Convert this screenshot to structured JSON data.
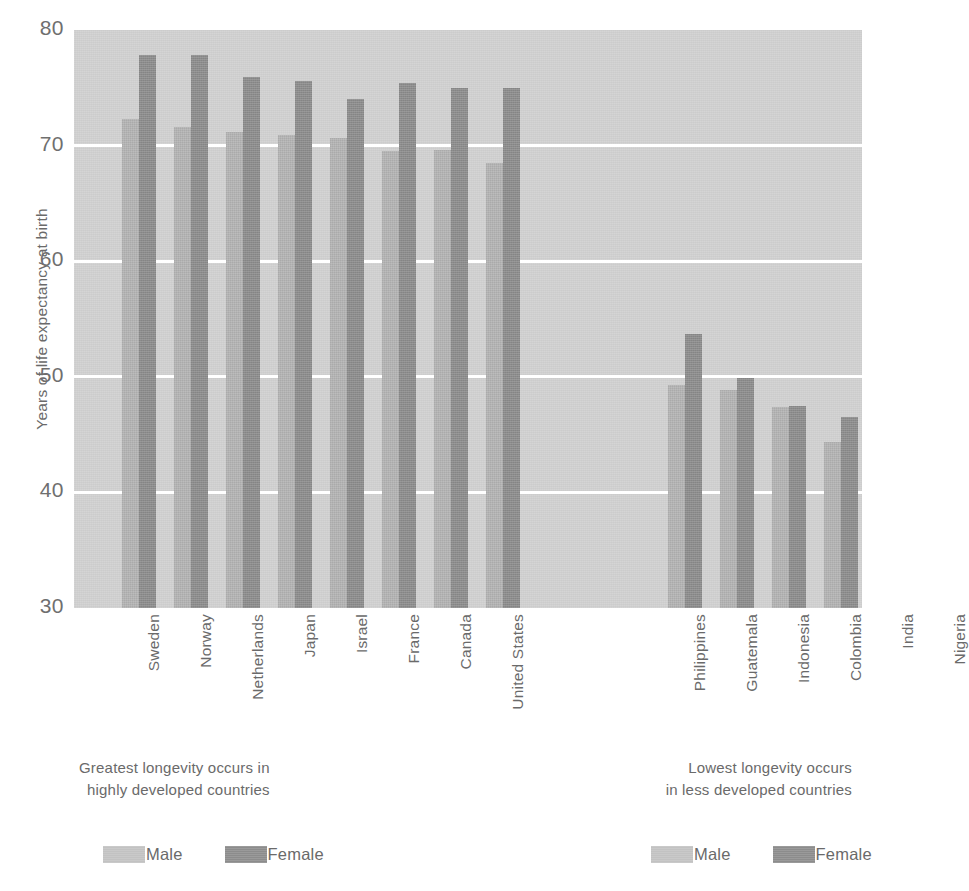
{
  "chart_data": {
    "type": "bar",
    "title": "",
    "xlabel": "",
    "ylabel": "Years of life expectancy at birth",
    "ylim": [
      30,
      80
    ],
    "yticks": [
      80,
      70,
      60,
      50,
      40,
      30
    ],
    "grid": true,
    "legend_position": "bottom",
    "series": [
      {
        "name": "Male",
        "color": "#b3b3b3",
        "values": [
          72.3,
          71.6,
          71.2,
          70.9,
          70.7,
          69.5,
          69.6,
          68.5,
          49.3,
          48.9,
          47.4,
          44.4,
          41.9,
          37.9
        ]
      },
      {
        "name": "Female",
        "color": "#8c8c8c",
        "values": [
          77.8,
          77.8,
          75.9,
          75.6,
          74.0,
          75.4,
          75.0,
          75.0,
          53.7,
          49.9,
          47.5,
          46.5,
          40.8,
          37.5
        ]
      }
    ],
    "categories": [
      "Sweden",
      "Norway",
      "Netherlands",
      "Japan",
      "Israel",
      "France",
      "Canada",
      "United States",
      "Philippines",
      "Guatemala",
      "Indonesia",
      "Colombia",
      "India",
      "Nigeria"
    ],
    "groups": [
      {
        "name": "developed",
        "caption_line_1": "Greatest longevity occurs in",
        "caption_line_2": "highly developed countries",
        "categories": [
          "Sweden",
          "Norway",
          "Netherlands",
          "Japan",
          "Israel",
          "France",
          "Canada",
          "United States"
        ]
      },
      {
        "name": "less-developed",
        "caption_line_1": "Lowest longevity occurs",
        "caption_line_2": "in less developed countries",
        "categories": [
          "Philippines",
          "Guatemala",
          "Indonesia",
          "Colombia",
          "India",
          "Nigeria"
        ]
      }
    ]
  },
  "axis": {
    "y_title": "Years of life expectancy at birth",
    "y_ticks": [
      "80",
      "70",
      "60",
      "50",
      "40",
      "30"
    ]
  },
  "legend": {
    "male_label": "Male",
    "female_label": "Female",
    "male_color": "#c2c2c2",
    "female_color": "#8c8c8c"
  },
  "captions": {
    "left_line_1": "Greatest longevity occurs in",
    "left_line_2": "highly developed countries",
    "right_line_1": "Lowest longevity occurs",
    "right_line_2": "in less developed countries"
  },
  "colors": {
    "plot_background": "#cccccc",
    "gridline": "#ffffff",
    "page_background": "#ffffff",
    "text": "#6a6a6a"
  }
}
